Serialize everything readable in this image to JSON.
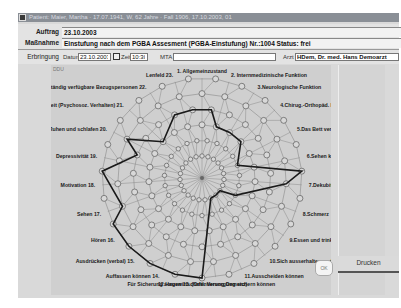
{
  "window": {
    "title": "Patient: Maier, Martha · 17.07.1941, W, 62 Jahre · Fall 1906, 17.10.2003, 01"
  },
  "form": {
    "auftrag_label": "Auftrag",
    "auftrag_value": "23.10.2003",
    "massnahme_label": "Maßnahme",
    "massnahme_value": "Einstufung nach dem PGBA Assesment (PGBA-Einstufung)  Nr.:1004  Status: frei",
    "erbringung_label": "Erbringung",
    "datum_label": "Datum",
    "datum_value": "23.10.2003",
    "zeit_label": "Zeit",
    "zeit_value": "10:30",
    "mta_label": "MTA",
    "mta_value": "",
    "arzt_label": "Arzt",
    "arzt_value": "HDem, Dr. med. Hans Demoarzt"
  },
  "panel": {
    "corner_label": "DDU"
  },
  "buttons": {
    "ok": "OK",
    "drucken": "Drucken"
  },
  "chart_data": {
    "type": "radar",
    "title": "",
    "axes": [
      "1. Allgemeinzustand",
      "2. Internmedizinische Funktion",
      "3.Neurologische Funktion",
      "4.Chirug.-Orthopäd. Funktion",
      "5.Das Bett verlassen können (Transfer)",
      "6.Sehen können",
      "7.Dekubitus",
      "8.Schmerz",
      "9.Essen und trinken",
      "10.Sich ausserhalten und kleiden können",
      "11.Ausscheiden können",
      "12.Hauswirtschaftl. Versorgung sichern können",
      "Für Sicherung sorgen 13. (Orientierung Demenz)",
      "Auffassen können 14.",
      "Ausdrücken (verbal) 15.",
      "Hören 16.",
      "Sehen 17.",
      "Motivation 18.",
      "Depressivität 19.",
      "Ruhen und schlafen 20.",
      "Situative Anpassungsfähigkeit (Psychosoz. Verhalten) 21.",
      "Ständig verfügbare Bezugspersonen 22.",
      "Lenfeld 23."
    ],
    "levels": 6,
    "rlim": [
      0,
      6
    ],
    "series": [
      {
        "name": "Einstufung",
        "values": [
          4,
          3,
          3,
          3,
          2,
          6,
          5,
          2,
          1,
          1,
          1,
          6,
          6,
          6,
          6,
          6,
          5,
          6,
          4,
          5,
          3,
          4,
          4
        ]
      }
    ]
  }
}
